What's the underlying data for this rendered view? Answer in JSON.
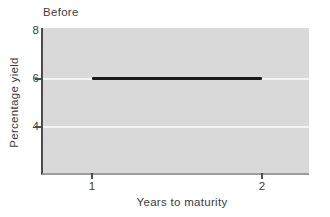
{
  "chart_data": {
    "type": "line",
    "title": "Before",
    "xlabel": "Years to maturity",
    "ylabel": "Percentage yield",
    "xlim": [
      0.712,
      2.276
    ],
    "ylim": [
      2.08,
      8.125
    ],
    "grid_on": true,
    "legend_position": "none",
    "x_ticks": [
      {
        "value": 1,
        "label": "1"
      },
      {
        "value": 2,
        "label": "2"
      }
    ],
    "y_ticks": [
      {
        "value": 8,
        "label": "8",
        "tick": false
      },
      {
        "value": 6,
        "label": "6",
        "tick": true
      },
      {
        "value": 4,
        "label": "4",
        "tick": true
      }
    ],
    "gridlines_y": [
      6,
      4
    ],
    "series": [
      {
        "name": "flat-yield-curve",
        "x": [
          1,
          2
        ],
        "y": [
          6,
          6
        ]
      }
    ],
    "colors": {
      "page_background": "#ffffff",
      "plot_background": "#d9d9d9",
      "gridline": "#f4f4f4",
      "axis_left": "#4b4b4b",
      "axis_bottom": "#9c9c9c",
      "tick": "#4b4b4b",
      "line": "#1a1a1a",
      "text": "#3b3b3b"
    }
  }
}
